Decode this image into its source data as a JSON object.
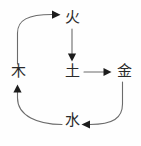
{
  "diagram": {
    "type": "cycle-diagram",
    "stroke_color": "#6b6b6b",
    "arrow_color": "#1c1c1c",
    "text_color": "#2a2a2a",
    "background_color": "#fefefe",
    "nodes": [
      {
        "id": "wood",
        "label": "木",
        "x": 18,
        "y": 72
      },
      {
        "id": "fire",
        "label": "火",
        "x": 72,
        "y": 18
      },
      {
        "id": "earth",
        "label": "土",
        "x": 72,
        "y": 72
      },
      {
        "id": "metal",
        "label": "金",
        "x": 124,
        "y": 72
      },
      {
        "id": "water",
        "label": "水",
        "x": 72,
        "y": 121
      }
    ],
    "edges": [
      {
        "id": "wood-to-fire",
        "from": "wood",
        "to": "fire",
        "shape": "curved",
        "arrow": "right"
      },
      {
        "id": "fire-to-earth",
        "from": "fire",
        "to": "earth",
        "shape": "straight-vertical",
        "arrow": "down"
      },
      {
        "id": "earth-to-metal",
        "from": "earth",
        "to": "metal",
        "shape": "straight-horizontal",
        "arrow": "right"
      },
      {
        "id": "metal-to-water",
        "from": "metal",
        "to": "water",
        "shape": "curved",
        "arrow": "left"
      },
      {
        "id": "water-to-wood",
        "from": "water",
        "to": "wood",
        "shape": "curved",
        "arrow": "up"
      }
    ]
  }
}
